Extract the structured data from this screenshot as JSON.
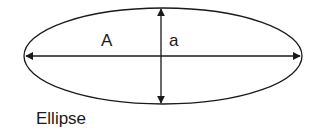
{
  "diagram": {
    "title": "Ellipse",
    "major_axis_label": "A",
    "minor_axis_label": "a",
    "shape": "ellipse",
    "stroke_color": "#1a1a1a",
    "background": "#ffffff"
  }
}
